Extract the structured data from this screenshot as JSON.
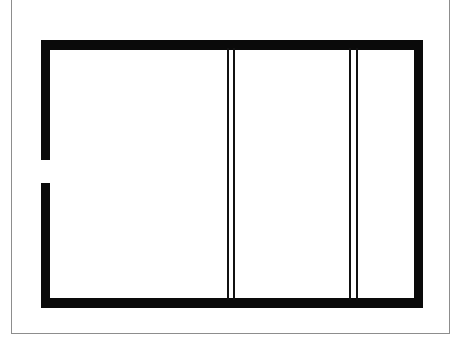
{
  "drawing": {
    "title": "Floor Plan Outline",
    "type": "architectural-line-drawing",
    "background_color": "#ffffff",
    "ink_color": "#0a0a0a",
    "page_border_color": "#8d8d8d",
    "canvas": {
      "width": 465,
      "height": 345
    }
  },
  "page_border": {
    "name": "page-border",
    "visible": true,
    "style": "hairline-rectangle",
    "top_edge_cropped": true
  },
  "walls": {
    "thickness_px": 9,
    "items": [
      {
        "id": "wall-top",
        "label": "Top Wall",
        "orientation": "horizontal",
        "x": 41,
        "y": 40,
        "length": 382,
        "thickness": 10
      },
      {
        "id": "wall-bottom",
        "label": "Bottom Wall",
        "orientation": "horizontal",
        "x": 41,
        "y": 298,
        "length": 382,
        "thickness": 10
      },
      {
        "id": "wall-right",
        "label": "Right Wall",
        "orientation": "vertical",
        "x": 414,
        "y": 40,
        "length": 268,
        "thickness": 9
      },
      {
        "id": "wall-left-upper",
        "label": "Left Wall Upper",
        "orientation": "vertical",
        "x": 41,
        "y": 40,
        "length": 120,
        "thickness": 9
      },
      {
        "id": "wall-left-lower",
        "label": "Left Wall Lower",
        "orientation": "vertical",
        "x": 41,
        "y": 183,
        "length": 125,
        "thickness": 9
      }
    ]
  },
  "openings": [
    {
      "id": "doorway-opening",
      "label": "Doorway Opening",
      "wall": "left",
      "x": 41,
      "y": 160,
      "width": 9,
      "height": 23
    }
  ],
  "partitions": {
    "line_thickness_px": 2,
    "groups": [
      {
        "id": "partition-left",
        "label": "Left Partition Pair",
        "lines": [
          {
            "id": "partition-left-a",
            "label": "Left Partition Line A",
            "x": 227,
            "y": 48,
            "height": 252
          },
          {
            "id": "partition-left-b",
            "label": "Left Partition Line B",
            "x": 233,
            "y": 48,
            "height": 252
          }
        ]
      },
      {
        "id": "partition-right",
        "label": "Right Partition Pair",
        "lines": [
          {
            "id": "partition-right-a",
            "label": "Right Partition Line A",
            "x": 349,
            "y": 48,
            "height": 252
          },
          {
            "id": "partition-right-b",
            "label": "Right Partition Line B",
            "x": 356,
            "y": 48,
            "height": 252
          }
        ]
      }
    ]
  },
  "rooms": [
    {
      "id": "room-left",
      "label": "Left Bay",
      "x": 50,
      "y": 50,
      "width": 177,
      "height": 248
    },
    {
      "id": "room-middle",
      "label": "Middle Bay",
      "x": 235,
      "y": 50,
      "width": 114,
      "height": 248
    },
    {
      "id": "room-right",
      "label": "Right Bay",
      "x": 358,
      "y": 50,
      "width": 56,
      "height": 248
    }
  ]
}
